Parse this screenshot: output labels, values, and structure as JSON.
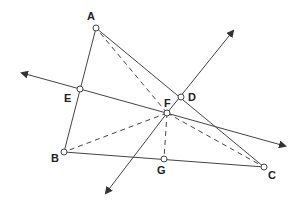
{
  "diagram": {
    "colors": {
      "line": "#444444",
      "point_fill": "#ffffff",
      "label": "#222222"
    },
    "points": [
      {
        "id": "A",
        "label": "A",
        "x": 96,
        "y": 28,
        "lx": 87,
        "ly": 20
      },
      {
        "id": "E",
        "label": "E",
        "x": 80,
        "y": 89,
        "lx": 64,
        "ly": 102
      },
      {
        "id": "B",
        "label": "B",
        "x": 64,
        "y": 152,
        "lx": 51,
        "ly": 162
      },
      {
        "id": "D",
        "label": "D",
        "x": 181,
        "y": 97,
        "lx": 188,
        "ly": 101
      },
      {
        "id": "F",
        "label": "F",
        "x": 167,
        "y": 113,
        "lx": 164,
        "ly": 107
      },
      {
        "id": "G",
        "label": "G",
        "x": 164,
        "y": 159,
        "lx": 157,
        "ly": 174
      },
      {
        "id": "C",
        "label": "C",
        "x": 264,
        "y": 167,
        "lx": 268,
        "ly": 179
      }
    ],
    "labels": {
      "A": "A",
      "B": "B",
      "C": "C",
      "D": "D",
      "E": "E",
      "F": "F",
      "G": "G"
    }
  }
}
